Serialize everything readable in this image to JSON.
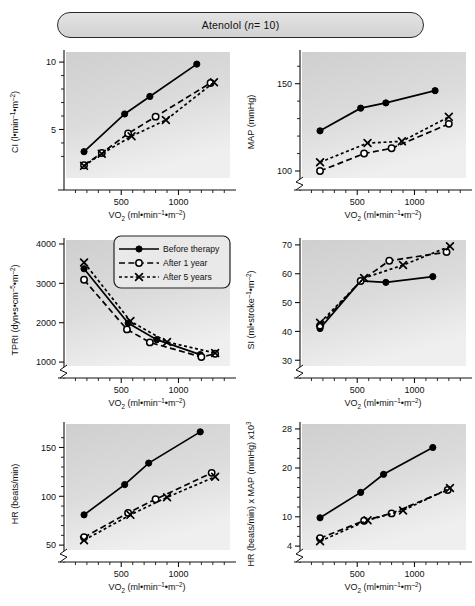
{
  "header": {
    "drug": "Atenolol",
    "n_label": "n",
    "n_equals": "= 10",
    "title_full": "Atenolol (n = 10)"
  },
  "legend": {
    "position": "top-right-of-TPRI-panel",
    "items": [
      {
        "label": "Before therapy",
        "marker": "filled-circle",
        "line": "solid",
        "color": "#000000"
      },
      {
        "label": "After 1 year",
        "marker": "open-circle",
        "line": "dashed",
        "color": "#000000"
      },
      {
        "label": "After 5 years",
        "marker": "cross-x",
        "line": "dotted",
        "color": "#000000"
      }
    ]
  },
  "axis_common": {
    "xlabel_main": "VO",
    "xlabel_sub": "2",
    "xlabel_units": " (ml•min",
    "xlabel_sup1": "–1",
    "xlabel_mid": "•m",
    "xlabel_sup2": "–2",
    "xlabel_close": ")",
    "xticks": [
      500,
      1000
    ],
    "xlim": [
      0,
      1450
    ],
    "xminor": [
      100,
      200,
      300,
      400,
      600,
      700,
      800,
      900,
      1100,
      1200,
      1300,
      1400
    ]
  },
  "chart_data": [
    {
      "id": "ci",
      "type": "line",
      "title": "",
      "ylabel": "CI (l•min–1•m–2)",
      "ylabel_parts": {
        "name": "CI (l",
        "d1": "•min",
        "s1": "–1",
        "d2": "•m",
        "s2": "–2",
        "end": ")"
      },
      "xlabel": "VO2 (ml•min–1•m–2)",
      "yticks": [
        5,
        10
      ],
      "yminor": [
        3,
        4,
        6,
        7,
        8,
        9
      ],
      "ylim": [
        1.4,
        10.6
      ],
      "axis_break": false,
      "grid": false,
      "series": [
        {
          "name": "Before therapy",
          "x": [
            175,
            530,
            750,
            1160
          ],
          "y": [
            3.35,
            6.15,
            7.45,
            9.85
          ]
        },
        {
          "name": "After 1 year",
          "x": [
            175,
            330,
            560,
            800,
            1280
          ],
          "y": [
            2.35,
            3.25,
            4.7,
            5.95,
            8.45
          ]
        },
        {
          "name": "After 5 years",
          "x": [
            175,
            330,
            590,
            890,
            1310
          ],
          "y": [
            2.3,
            3.2,
            4.5,
            5.7,
            8.5
          ]
        }
      ]
    },
    {
      "id": "map",
      "type": "line",
      "ylabel": "MAP (mmHg)",
      "ylabel_parts": {
        "name": "MAP (mmHg)",
        "d1": "",
        "s1": "",
        "d2": "",
        "s2": "",
        "end": ""
      },
      "xlabel": "VO2 (ml•min–1•m–2)",
      "yticks": [
        100,
        150
      ],
      "yminor": [
        110,
        120,
        130,
        140,
        160
      ],
      "ylim": [
        96,
        167
      ],
      "axis_break": true,
      "grid": false,
      "series": [
        {
          "name": "Before therapy",
          "x": [
            175,
            530,
            750,
            1180
          ],
          "y": [
            123,
            136,
            139,
            146
          ]
        },
        {
          "name": "After 1 year",
          "x": [
            175,
            560,
            800,
            1300
          ],
          "y": [
            100,
            110,
            113,
            127
          ]
        },
        {
          "name": "After 5 years",
          "x": [
            175,
            590,
            890,
            1300
          ],
          "y": [
            105,
            116,
            117,
            131
          ]
        }
      ]
    },
    {
      "id": "tpri",
      "type": "line",
      "ylabel": "TPRI (dyn•s•cm–5•m–2)",
      "ylabel_parts": {
        "name": "TPRI (dyn•s•cm",
        "d1": "",
        "s1": "–5",
        "d2": "•m",
        "s2": "–2",
        "end": ")"
      },
      "xlabel": "VO2 (ml•min–1•m–2)",
      "yticks": [
        1000,
        2000,
        3000,
        4000
      ],
      "yminor": [],
      "ylim": [
        900,
        4050
      ],
      "axis_break": true,
      "grid": false,
      "has_legend": true,
      "series": [
        {
          "name": "Before therapy",
          "x": [
            175,
            560,
            810,
            1190
          ],
          "y": [
            3370,
            1990,
            1570,
            1190
          ]
        },
        {
          "name": "After 1 year",
          "x": [
            175,
            550,
            750,
            1200,
            1320
          ],
          "y": [
            3090,
            1830,
            1500,
            1130,
            1210
          ]
        },
        {
          "name": "After 5 years",
          "x": [
            175,
            580,
            900,
            1320
          ],
          "y": [
            3530,
            2040,
            1510,
            1230
          ]
        }
      ]
    },
    {
      "id": "si",
      "type": "line",
      "ylabel": "SI (ml•stroke–1•m–2)",
      "ylabel_parts": {
        "name": "SI (ml•stroke",
        "d1": "",
        "s1": "–1",
        "d2": "•m",
        "s2": "–2",
        "end": ")"
      },
      "xlabel": "VO2 (ml•min–1•m–2)",
      "yticks": [
        30,
        40,
        50,
        60,
        70
      ],
      "yminor": [],
      "ylim": [
        28,
        71
      ],
      "axis_break": true,
      "grid": false,
      "series": [
        {
          "name": "Before therapy",
          "x": [
            175,
            530,
            750,
            1160
          ],
          "y": [
            41,
            57.5,
            57,
            59
          ]
        },
        {
          "name": "After 1 year",
          "x": [
            175,
            530,
            780,
            1280
          ],
          "y": [
            42,
            57.5,
            64.5,
            67.5
          ]
        },
        {
          "name": "After 5 years",
          "x": [
            175,
            560,
            900,
            1310
          ],
          "y": [
            43,
            58.5,
            63,
            69.5
          ]
        }
      ]
    },
    {
      "id": "hr",
      "type": "line",
      "ylabel": "HR (beats/min)",
      "ylabel_parts": {
        "name": "HR (beats/min)",
        "d1": "",
        "s1": "",
        "d2": "",
        "s2": "",
        "end": ""
      },
      "xlabel": "VO2 (ml•min–1•m–2)",
      "yticks": [
        50,
        100,
        150
      ],
      "yminor": [
        60,
        70,
        80,
        90,
        110,
        120,
        130,
        140,
        160
      ],
      "ylim": [
        45,
        172
      ],
      "axis_break": true,
      "grid": false,
      "series": [
        {
          "name": "Before therapy",
          "x": [
            175,
            530,
            740,
            1190
          ],
          "y": [
            81,
            112,
            134,
            166
          ]
        },
        {
          "name": "After 1 year",
          "x": [
            175,
            560,
            800,
            1290
          ],
          "y": [
            58,
            83,
            97,
            124
          ]
        },
        {
          "name": "After 5 years",
          "x": [
            175,
            580,
            900,
            1320
          ],
          "y": [
            55,
            81,
            99,
            120
          ]
        }
      ]
    },
    {
      "id": "rpp",
      "type": "line",
      "ylabel": "HR (beats/min) x MAP (mmHg) x103",
      "ylabel_parts": {
        "name": "HR (beats/min) x MAP (mmHg) x10",
        "d1": "",
        "s1": "3",
        "d2": "",
        "s2": "",
        "end": ""
      },
      "xlabel": "VO2 (ml•min–1•m–2)",
      "yticks": [
        4,
        10,
        20,
        28
      ],
      "yminor": [
        6,
        8,
        12,
        14,
        16,
        18,
        22,
        24,
        26
      ],
      "ylim": [
        3.2,
        28.6
      ],
      "axis_break": true,
      "grid": false,
      "series": [
        {
          "name": "Before therapy",
          "x": [
            175,
            530,
            730,
            1160
          ],
          "y": [
            9.8,
            15.0,
            18.7,
            24.2
          ]
        },
        {
          "name": "After 1 year",
          "x": [
            175,
            560,
            800,
            1290
          ],
          "y": [
            5.6,
            9.2,
            10.7,
            15.5
          ]
        },
        {
          "name": "After 5 years",
          "x": [
            175,
            590,
            900,
            1310
          ],
          "y": [
            5.0,
            9.3,
            11.3,
            15.9
          ]
        }
      ]
    }
  ]
}
